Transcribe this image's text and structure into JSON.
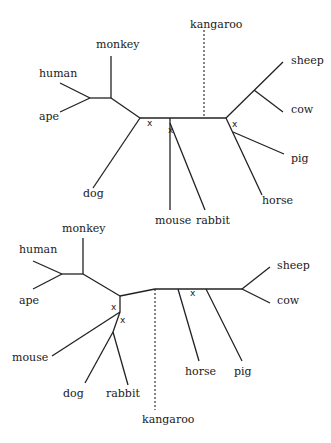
{
  "diagram": {
    "type": "unrooted phylogenetic trees",
    "top_tree": {
      "leaves": {
        "monkey": "monkey",
        "human": "human",
        "ape": "ape",
        "dog": "dog",
        "mouse": "mouse",
        "rabbit": "rabbit",
        "kangaroo": "kangaroo",
        "sheep": "sheep",
        "cow": "cow",
        "pig": "pig",
        "horse": "horse"
      },
      "marks": [
        "x",
        "x",
        "x"
      ],
      "dashed_leaf": "kangaroo"
    },
    "bottom_tree": {
      "leaves": {
        "monkey": "monkey",
        "human": "human",
        "ape": "ape",
        "mouse": "mouse",
        "dog": "dog",
        "rabbit": "rabbit",
        "kangaroo": "kangaroo",
        "horse": "horse",
        "pig": "pig",
        "sheep": "sheep",
        "cow": "cow"
      },
      "marks": [
        "x",
        "x",
        "x"
      ],
      "dashed_leaf": "kangaroo"
    }
  }
}
